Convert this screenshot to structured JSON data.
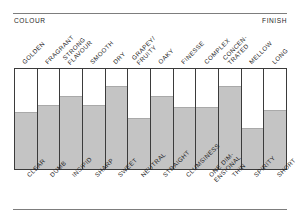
{
  "edges": {
    "left_caption": "COLOUR",
    "right_caption": "FINISH"
  },
  "chart_data": {
    "type": "bar",
    "title": "",
    "subtitle": "",
    "xlabel": "",
    "ylabel": "",
    "ylim": [
      0,
      100
    ],
    "grid": false,
    "legend_position": "none",
    "orientation": "vertical",
    "axis_left_annotation": "COLOUR",
    "axis_right_annotation": "FINISH",
    "top_categories": [
      "GOLDEN",
      "FRAGRANT",
      "STRONG FLAVOUR",
      "SMOOTH",
      "DRY",
      "GRAPEY/ FRUITY",
      "OAKY",
      "FINESSE",
      "COMPLEX",
      "CONCEN- TRATED",
      "MELLOW",
      "LONG"
    ],
    "bottom_categories": [
      "CLEAR",
      "DUMB",
      "INSIPID",
      "SHARP",
      "SWEET",
      "NEUTRAL",
      "STRAIGHT",
      "CLUMSINESS",
      "ONE DIM- ENSIONAL",
      "THIN",
      "SPIRITY",
      "SHORT"
    ],
    "values": [
      57,
      64,
      73,
      64,
      83,
      51,
      73,
      62,
      62,
      83,
      41,
      59
    ],
    "colors": {
      "fill": "#c4c4c4",
      "frame": "#3b3b3b",
      "rule": "#7d7d7d",
      "background": "#ffffff",
      "text": "#1f1f1f"
    }
  },
  "top_labels": [
    {
      "line1": "GOLDEN",
      "line2": ""
    },
    {
      "line1": "FRAGRANT",
      "line2": ""
    },
    {
      "line1": "STRONG",
      "line2": "FLAVOUR"
    },
    {
      "line1": "SMOOTH",
      "line2": ""
    },
    {
      "line1": "DRY",
      "line2": ""
    },
    {
      "line1": "GRAPEY/",
      "line2": "FRUITY"
    },
    {
      "line1": "OAKY",
      "line2": ""
    },
    {
      "line1": "FINESSE",
      "line2": ""
    },
    {
      "line1": "COMPLEX",
      "line2": ""
    },
    {
      "line1": "CONCEN-",
      "line2": "TRATED"
    },
    {
      "line1": "MELLOW",
      "line2": ""
    },
    {
      "line1": "LONG",
      "line2": ""
    }
  ],
  "bottom_labels": [
    {
      "line1": "CLEAR",
      "line2": ""
    },
    {
      "line1": "DUMB",
      "line2": ""
    },
    {
      "line1": "INSIPID",
      "line2": ""
    },
    {
      "line1": "SHARP",
      "line2": ""
    },
    {
      "line1": "SWEET",
      "line2": ""
    },
    {
      "line1": "NEUTRAL",
      "line2": ""
    },
    {
      "line1": "STRAIGHT",
      "line2": ""
    },
    {
      "line1": "CLUMSINESS",
      "line2": ""
    },
    {
      "line1": "ONE DIM-",
      "line2": "ENSIONAL"
    },
    {
      "line1": "THIN",
      "line2": ""
    },
    {
      "line1": "SPIRITY",
      "line2": ""
    },
    {
      "line1": "SHORT",
      "line2": ""
    }
  ]
}
